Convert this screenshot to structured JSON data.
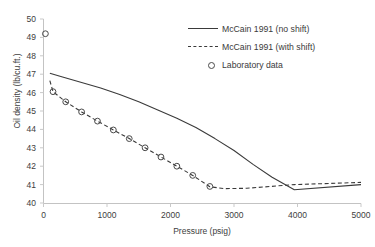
{
  "chart_data": {
    "type": "line",
    "title": "",
    "xlabel": "Pressure (psig)",
    "ylabel": "Oil density (lb/cu.ft.)",
    "xlim": [
      0,
      5000
    ],
    "ylim": [
      40,
      50
    ],
    "xticks": [
      0,
      1000,
      2000,
      3000,
      4000,
      5000
    ],
    "yticks": [
      40,
      41,
      42,
      43,
      44,
      45,
      46,
      47,
      48,
      49,
      50
    ],
    "grid": false,
    "legend_position": "top-right",
    "series": [
      {
        "name": "McCain 1991 (no shift)",
        "style": "solid",
        "color": "#3a3a3a",
        "points": [
          [
            100,
            47.05
          ],
          [
            300,
            46.85
          ],
          [
            600,
            46.55
          ],
          [
            900,
            46.25
          ],
          [
            1200,
            45.9
          ],
          [
            1500,
            45.5
          ],
          [
            1800,
            45.05
          ],
          [
            2100,
            44.6
          ],
          [
            2400,
            44.1
          ],
          [
            2700,
            43.5
          ],
          [
            3000,
            42.85
          ],
          [
            3300,
            42.1
          ],
          [
            3600,
            41.4
          ],
          [
            3950,
            40.72
          ],
          [
            5000,
            41.0
          ]
        ]
      },
      {
        "name": "McCain 1991 (with shift)",
        "style": "dashed",
        "color": "#3a3a3a",
        "points": [
          [
            100,
            46.65
          ],
          [
            150,
            46.05
          ],
          [
            350,
            45.5
          ],
          [
            600,
            44.95
          ],
          [
            850,
            44.45
          ],
          [
            1100,
            43.97
          ],
          [
            1350,
            43.5
          ],
          [
            1600,
            43.0
          ],
          [
            1850,
            42.5
          ],
          [
            2100,
            42.0
          ],
          [
            2350,
            41.5
          ],
          [
            2620,
            40.88
          ],
          [
            2850,
            40.78
          ],
          [
            3200,
            40.8
          ],
          [
            3950,
            41.0
          ],
          [
            5000,
            41.12
          ]
        ]
      },
      {
        "name": "Laboratory data",
        "style": "markers",
        "marker": "open-circle",
        "color": "#4a4a4a",
        "points": [
          [
            30,
            49.2
          ],
          [
            150,
            46.05
          ],
          [
            350,
            45.5
          ],
          [
            600,
            44.95
          ],
          [
            850,
            44.45
          ],
          [
            1100,
            43.97
          ],
          [
            1350,
            43.5
          ],
          [
            1600,
            43.0
          ],
          [
            1850,
            42.5
          ],
          [
            2100,
            42.0
          ],
          [
            2350,
            41.5
          ],
          [
            2620,
            40.9
          ]
        ]
      }
    ]
  },
  "axes": {
    "x_title": "Pressure (psig)",
    "y_title": "Oil density (lb/cu.ft.)",
    "x_tick_labels": [
      "0",
      "1000",
      "2000",
      "3000",
      "4000",
      "5000"
    ],
    "y_tick_labels": [
      "40",
      "41",
      "42",
      "43",
      "44",
      "45",
      "46",
      "47",
      "48",
      "49",
      "50"
    ],
    "axis_color": "#bfbfbf"
  },
  "legend": {
    "items": [
      {
        "label": "McCain 1991 (no shift)",
        "key": "solid-line"
      },
      {
        "label": "McCain 1991 (with shift)",
        "key": "dashed-line"
      },
      {
        "label": "Laboratory data",
        "key": "open-circle-marker"
      }
    ]
  }
}
